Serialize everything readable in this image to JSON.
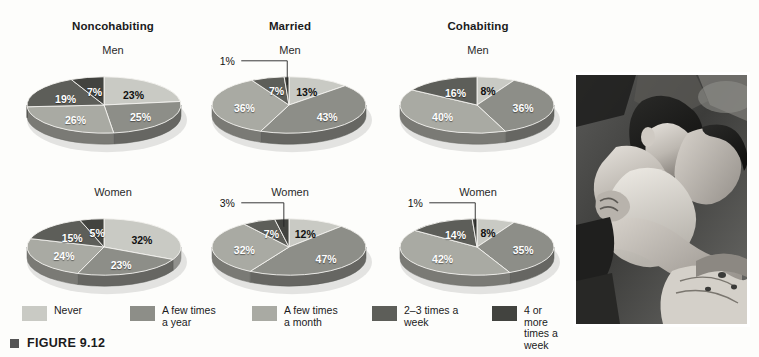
{
  "figure": {
    "caption": "FIGURE 9.12",
    "bullet_icon": "square-bullet-icon"
  },
  "columns": [
    {
      "label": "Noncohabiting"
    },
    {
      "label": "Married"
    },
    {
      "label": "Cohabiting"
    }
  ],
  "rows": [
    {
      "label": "Men"
    },
    {
      "label": "Women"
    }
  ],
  "palette": {
    "never": "#c9cac4",
    "few_times_year": "#8d8e88",
    "few_times_month": "#a9aaa3",
    "two_three_week": "#5d5e59",
    "four_or_more_week": "#42433f",
    "edge_dark": "#6f706a",
    "background": "#fdfdfb"
  },
  "legend": {
    "items": [
      {
        "label": "Never",
        "color_key": "never"
      },
      {
        "label": "A few times\na year",
        "color_key": "few_times_year"
      },
      {
        "label": "A few times\na month",
        "color_key": "few_times_month"
      },
      {
        "label": "2–3 times  a\nweek",
        "color_key": "two_three_week"
      },
      {
        "label": "4 or more\ntimes a week",
        "color_key": "four_or_more_week"
      }
    ]
  },
  "photo": {
    "alt": "Black and white photograph of a couple embracing",
    "name": "couple-embracing-photo"
  },
  "chart_data": {
    "type": "pie",
    "title": "FIGURE 9.12",
    "legend_position": "bottom",
    "categories": [
      "Never",
      "A few times a year",
      "A few times a month",
      "2–3 times a week",
      "4 or more times a week"
    ],
    "charts": [
      {
        "id": "noncohabiting-men",
        "column": "Noncohabiting",
        "row": "Men",
        "values": [
          23,
          25,
          26,
          19,
          7
        ],
        "labels": [
          "23%",
          "25%",
          "26%",
          "19%",
          "7%"
        ],
        "callout": null
      },
      {
        "id": "married-men",
        "column": "Married",
        "row": "Men",
        "values": [
          13,
          43,
          36,
          7,
          1
        ],
        "labels": [
          "13%",
          "43%",
          "36%",
          "7%",
          "1%"
        ],
        "callout": {
          "label": "1%",
          "value": 1
        }
      },
      {
        "id": "cohabiting-men",
        "column": "Cohabiting",
        "row": "Men",
        "values": [
          8,
          36,
          40,
          16,
          0
        ],
        "labels": [
          "8%",
          "36%",
          "40%",
          "16%",
          ""
        ],
        "callout": null
      },
      {
        "id": "noncohabiting-women",
        "column": "Noncohabiting",
        "row": "Women",
        "values": [
          32,
          23,
          24,
          15,
          5
        ],
        "labels": [
          "32%",
          "23%",
          "24%",
          "15%",
          "5%"
        ],
        "callout": null
      },
      {
        "id": "married-women",
        "column": "Married",
        "row": "Women",
        "values": [
          12,
          47,
          32,
          7,
          3
        ],
        "labels": [
          "12%",
          "47%",
          "32%",
          "7%",
          "3%"
        ],
        "callout": {
          "label": "3%",
          "value": 3
        }
      },
      {
        "id": "cohabiting-women",
        "column": "Cohabiting",
        "row": "Women",
        "values": [
          8,
          35,
          42,
          14,
          1
        ],
        "labels": [
          "8%",
          "35%",
          "42%",
          "14%",
          "1%"
        ],
        "callout": {
          "label": "1%",
          "value": 1
        }
      }
    ]
  }
}
